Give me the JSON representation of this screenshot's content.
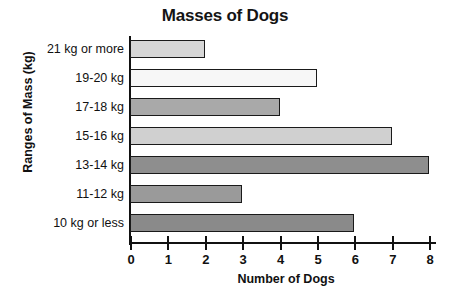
{
  "chart_data": {
    "type": "bar",
    "orientation": "horizontal",
    "title": "Masses of Dogs",
    "xlabel": "Number of Dogs",
    "ylabel": "Ranges of Mass (kg)",
    "categories": [
      "21 kg or more",
      "19-20 kg",
      "17-18 kg",
      "15-16 kg",
      "13-14 kg",
      "11-12 kg",
      "10 kg or less"
    ],
    "values": [
      2,
      5,
      4,
      7,
      8,
      3,
      6
    ],
    "bar_colors": [
      "#d6d6d6",
      "#f7f7f7",
      "#a9a9a9",
      "#d0d0d0",
      "#8e8e8e",
      "#9a9a9a",
      "#8a8a8a"
    ],
    "bar_outline_color": "#1a1a1a",
    "xlim": [
      0,
      8
    ],
    "xticks": [
      0,
      1,
      2,
      3,
      4,
      5,
      6,
      7,
      8
    ],
    "xtick_labels": [
      "0",
      "1",
      "2",
      "3",
      "4",
      "5",
      "6",
      "7",
      "8"
    ],
    "grid": false,
    "legend": false
  }
}
